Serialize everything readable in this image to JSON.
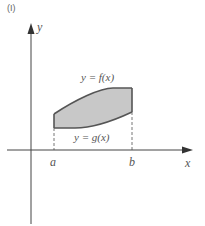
{
  "figure": {
    "panel_label": "(I)",
    "axes": {
      "x_label": "x",
      "y_label": "y"
    },
    "ticks": {
      "a": "a",
      "b": "b"
    },
    "curves": {
      "upper": "y = f(x)",
      "lower": "y = g(x)"
    },
    "region": {
      "description": "shaded region between f and g from a to b",
      "fill_color": "#c8c8c8",
      "stroke_color": "#555555"
    }
  }
}
